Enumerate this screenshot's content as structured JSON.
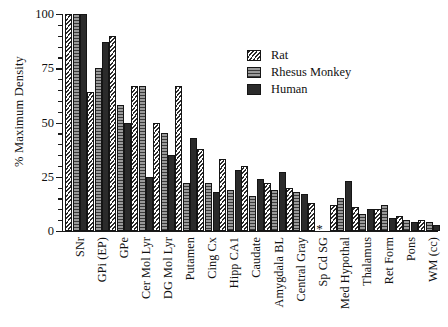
{
  "chart_data": {
    "type": "bar",
    "title": "",
    "xlabel": "",
    "ylabel": "% Maximum Density",
    "ylim": [
      0,
      100
    ],
    "yticks": [
      0,
      25,
      50,
      75,
      100
    ],
    "ytick_labels": [
      "0",
      "25",
      "50",
      "75",
      "100"
    ],
    "minor_ticks": true,
    "grid": false,
    "legend_position": "upper-right",
    "categories": [
      "SNr",
      "GPi (EP)",
      "GPe",
      "Cer Mol Lyr",
      "DG Mol Lyr",
      "Putamen",
      "Cing Cx",
      "Hipp CA1",
      "Caudate",
      "Amygdala BL",
      "Central Gray",
      "Sp Cd SG",
      "Med Hypothal",
      "Thalamus",
      "Ret Form",
      "Pons",
      "WM (cc)"
    ],
    "series": [
      {
        "name": "Rat",
        "pattern": "diagonal-hatch",
        "color": "#ffffff",
        "values": [
          100,
          64,
          90,
          67,
          50,
          67,
          38,
          33,
          30,
          22,
          20,
          13,
          12,
          11,
          10,
          7,
          5
        ]
      },
      {
        "name": "Rhesus Monkey",
        "pattern": "horizontal-lines",
        "color": "#8e8e8e",
        "values": [
          100,
          75,
          58,
          67,
          45,
          22,
          22,
          19,
          16,
          19,
          18,
          null,
          15,
          8,
          12,
          5,
          4
        ]
      },
      {
        "name": "Human",
        "pattern": "solid",
        "color": "#2b2b2b",
        "values": [
          100,
          87,
          50,
          25,
          35,
          43,
          18,
          28,
          24,
          27,
          17,
          null,
          23,
          10,
          6,
          4,
          3
        ]
      }
    ],
    "annotations": [
      {
        "category": "Sp Cd SG",
        "symbol": "*",
        "meaning": "data not available"
      }
    ]
  },
  "legend": {
    "entries": [
      {
        "label": "Rat"
      },
      {
        "label": "Rhesus Monkey"
      },
      {
        "label": "Human"
      }
    ]
  }
}
